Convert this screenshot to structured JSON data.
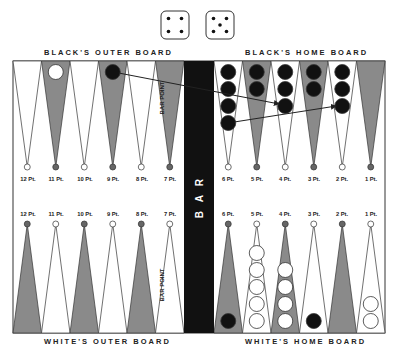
{
  "dice": [
    {
      "value": 4,
      "label": "die showing 4"
    },
    {
      "value": 5,
      "label": "die showing 5"
    }
  ],
  "board_titles": {
    "top_left": "BLACK'S OUTER BOARD",
    "top_right": "BLACK'S HOME BOARD",
    "bottom_left": "WHITE'S OUTER BOARD",
    "bottom_right": "WHITE'S HOME BOARD"
  },
  "bar": {
    "letters": [
      "B",
      "A",
      "R"
    ],
    "bar_point_label": "BAR POINT"
  },
  "top_points": [
    {
      "label": "12 Pt.",
      "shade": "light"
    },
    {
      "label": "11 Pt.",
      "shade": "dark"
    },
    {
      "label": "10 Pt.",
      "shade": "light"
    },
    {
      "label": "9 Pt.",
      "shade": "dark"
    },
    {
      "label": "8 Pt.",
      "shade": "light"
    },
    {
      "label": "7 Pt.",
      "shade": "dark"
    },
    {
      "label": "6 Pt.",
      "shade": "light"
    },
    {
      "label": "5 Pt.",
      "shade": "dark"
    },
    {
      "label": "4 Pt.",
      "shade": "light"
    },
    {
      "label": "3 Pt.",
      "shade": "dark"
    },
    {
      "label": "2 Pt.",
      "shade": "light"
    },
    {
      "label": "1 Pt.",
      "shade": "dark"
    }
  ],
  "bottom_points": [
    {
      "label": "12 Pt.",
      "shade": "dark"
    },
    {
      "label": "11 Pt.",
      "shade": "light"
    },
    {
      "label": "10 Pt.",
      "shade": "dark"
    },
    {
      "label": "9 Pt.",
      "shade": "light"
    },
    {
      "label": "8 Pt.",
      "shade": "dark"
    },
    {
      "label": "7 Pt.",
      "shade": "light"
    },
    {
      "label": "6 Pt.",
      "shade": "dark"
    },
    {
      "label": "5 Pt.",
      "shade": "light"
    },
    {
      "label": "4 Pt.",
      "shade": "dark"
    },
    {
      "label": "3 Pt.",
      "shade": "light"
    },
    {
      "label": "2 Pt.",
      "shade": "dark"
    },
    {
      "label": "1 Pt.",
      "shade": "light"
    }
  ],
  "checkers": {
    "top": [
      {
        "point_index": 1,
        "color": "white",
        "count": 1
      },
      {
        "point_index": 3,
        "color": "black",
        "count": 1
      },
      {
        "point_index": 6,
        "color": "black",
        "count": 4
      },
      {
        "point_index": 7,
        "color": "black",
        "count": 2
      },
      {
        "point_index": 8,
        "color": "black",
        "count": 3
      },
      {
        "point_index": 9,
        "color": "black",
        "count": 2
      },
      {
        "point_index": 10,
        "color": "black",
        "count": 3
      }
    ],
    "bottom": [
      {
        "point_index": 6,
        "color": "black",
        "count": 1
      },
      {
        "point_index": 7,
        "color": "white",
        "count": 5
      },
      {
        "point_index": 8,
        "color": "white",
        "count": 4
      },
      {
        "point_index": 9,
        "color": "black",
        "count": 1
      },
      {
        "point_index": 11,
        "color": "white",
        "count": 2
      }
    ]
  },
  "moves": [
    {
      "from": "9 Pt. (black outer board)",
      "to": "4 Pt. (black home board)"
    },
    {
      "from": "6 Pt. (black home board)",
      "to": "2 Pt. (black home board)"
    }
  ],
  "colors": {
    "dark_point": "#8a8a8a",
    "light_point": "#ffffff",
    "bar": "#111111",
    "black_checker": "#111111",
    "white_checker": "#ffffff",
    "outline": "#333333"
  }
}
